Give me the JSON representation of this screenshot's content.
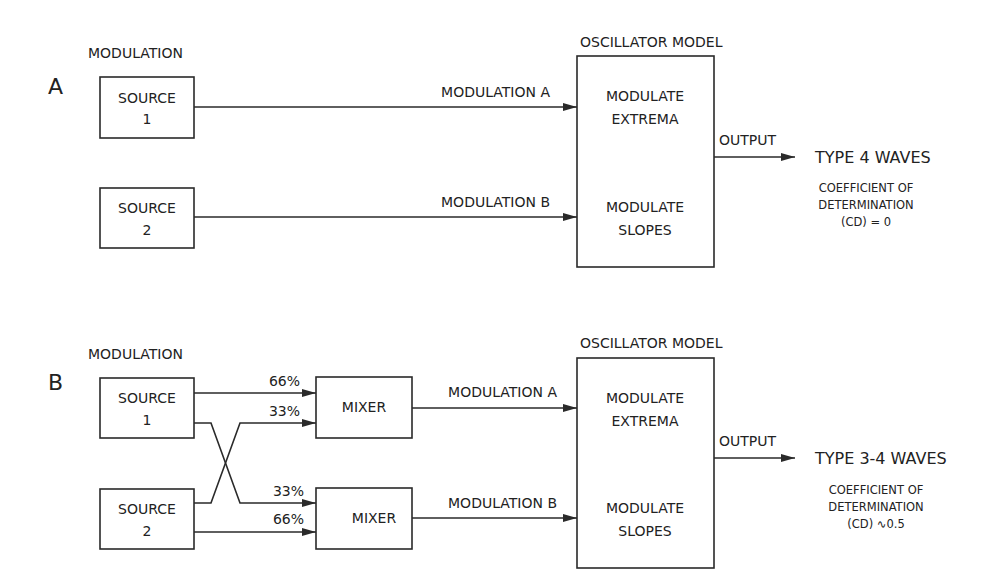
{
  "panels": {
    "A": {
      "letter": "A",
      "modulation_heading": "MODULATION",
      "oscillator_heading": "OSCILLATOR MODEL",
      "sources": [
        {
          "line1": "SOURCE",
          "line2": "1"
        },
        {
          "line1": "SOURCE",
          "line2": "2"
        }
      ],
      "signals": [
        "MODULATION A",
        "MODULATION B"
      ],
      "oscillator_sections": [
        {
          "line1": "MODULATE",
          "line2": "EXTREMA"
        },
        {
          "line1": "MODULATE",
          "line2": "SLOPES"
        }
      ],
      "output_label": "OUTPUT",
      "result_title": "TYPE 4 WAVES",
      "result_note": [
        "COEFFICIENT OF",
        "DETERMINATION",
        "(CD) = 0"
      ]
    },
    "B": {
      "letter": "B",
      "modulation_heading": "MODULATION",
      "oscillator_heading": "OSCILLATOR MODEL",
      "sources": [
        {
          "line1": "SOURCE",
          "line2": "1"
        },
        {
          "line1": "SOURCE",
          "line2": "2"
        }
      ],
      "mixers": [
        "MIXER",
        "MIXER"
      ],
      "mix_weights": {
        "mixer1_from_source1": "66%",
        "mixer1_from_source2": "33%",
        "mixer2_from_source1": "33%",
        "mixer2_from_source2": "66%"
      },
      "signals": [
        "MODULATION A",
        "MODULATION B"
      ],
      "oscillator_sections": [
        {
          "line1": "MODULATE",
          "line2": "EXTREMA"
        },
        {
          "line1": "MODULATE",
          "line2": "SLOPES"
        }
      ],
      "output_label": "OUTPUT",
      "result_title": "TYPE 3-4 WAVES",
      "result_note": [
        "COEFFICIENT OF",
        "DETERMINATION",
        "(CD) ∿0.5"
      ]
    }
  }
}
